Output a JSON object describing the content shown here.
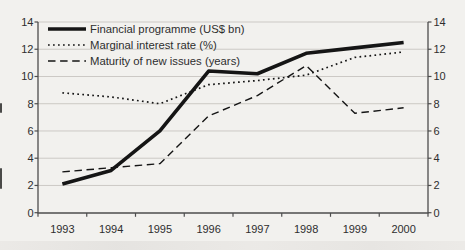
{
  "chart_data": {
    "type": "line",
    "title": "",
    "xlabel": "",
    "ylabel": "",
    "x": [
      "1993",
      "1994",
      "1995",
      "1996",
      "1997",
      "1998",
      "1999",
      "2000"
    ],
    "series": [
      {
        "id": "financial-programme",
        "name": "Financial programme (US$ bn)",
        "style": "solid",
        "stroke_width": 3.6,
        "values": [
          2.1,
          3.1,
          6.0,
          10.4,
          10.2,
          11.7,
          12.1,
          12.5
        ]
      },
      {
        "id": "marginal-interest-rate",
        "name": "Marginal interest rate (%)",
        "style": "dotted",
        "stroke_width": 1.7,
        "values": [
          8.8,
          8.5,
          8.0,
          9.4,
          9.7,
          10.1,
          11.4,
          11.8
        ]
      },
      {
        "id": "maturity-new-issues",
        "name": "Maturity of new issues (years)",
        "style": "dashed",
        "stroke_width": 1.4,
        "values": [
          3.0,
          3.3,
          3.6,
          7.1,
          8.6,
          10.8,
          7.3,
          7.7
        ]
      }
    ],
    "ylim": [
      0,
      14
    ],
    "yticks": [
      0,
      2,
      4,
      6,
      8,
      10,
      12,
      14
    ],
    "y_axis_sides": [
      "left",
      "right"
    ],
    "grid": true,
    "legend_position": "top-left-inside",
    "colors": {
      "line": "#151515",
      "grid": "#ccc9c5",
      "axis": "#4d4d4d",
      "text": "#2e2e2e",
      "background": "#f2f1ee"
    }
  }
}
